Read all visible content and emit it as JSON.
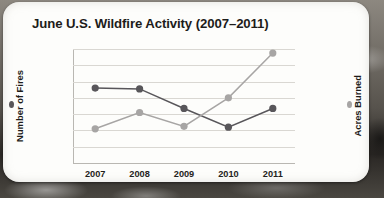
{
  "chart_data": {
    "type": "line",
    "title": "June U.S. Wildfire Activity (2007–2011)",
    "xlabel": "",
    "categories": [
      "2007",
      "2008",
      "2009",
      "2010",
      "2011"
    ],
    "grid": true,
    "legend_position": "axis-titles",
    "series": [
      {
        "name": "Number of Fires",
        "axis": "left",
        "color": "#58565a",
        "values": [
          9200,
          9100,
          6700,
          4400,
          6700
        ]
      },
      {
        "name": "Acres Burned",
        "axis": "right",
        "color": "#a7a5a4",
        "values": [
          420000,
          620000,
          450000,
          800000,
          1350000
        ]
      }
    ],
    "left_axis": {
      "label": "Number of Fires",
      "ylim": [
        0,
        14000
      ],
      "ticks": [
        0,
        2000,
        4000,
        6000,
        8000,
        10000,
        12000,
        14000
      ],
      "tick_labels": [
        "0",
        "2,000",
        "4,000",
        "6,000",
        "8,000",
        "10,000",
        "12,000",
        "14,000"
      ]
    },
    "right_axis": {
      "label": "Acres Burned",
      "ylim": [
        0,
        1400000
      ],
      "ticks": [
        0,
        200000,
        400000,
        600000,
        800000,
        1000000,
        1200000,
        1400000
      ],
      "tick_labels": [
        "0",
        "200,000",
        "400,000",
        "600,000",
        "800,000",
        "1,000,000",
        "1,200,000",
        "1,400,000"
      ]
    }
  }
}
